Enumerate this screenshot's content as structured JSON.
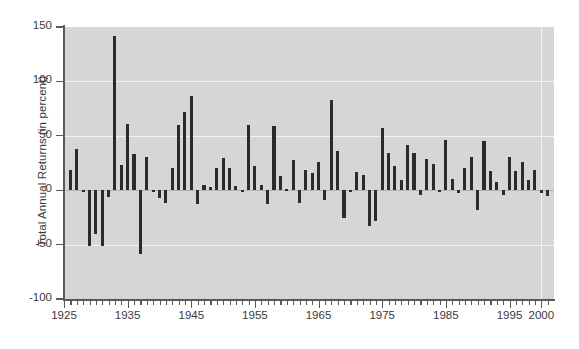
{
  "chart_data": {
    "type": "bar",
    "title": "",
    "xlabel": "",
    "ylabel": "Total Annual Returns (in percent)",
    "xlim": [
      1925,
      2002
    ],
    "ylim": [
      -100,
      150
    ],
    "yticks": [
      -100,
      -50,
      0,
      50,
      100,
      150
    ],
    "ytick_labels": [
      "-100",
      "-50",
      "0",
      "50",
      "100",
      "150"
    ],
    "xticks": [
      1925,
      1935,
      1945,
      1955,
      1965,
      1975,
      1985,
      1995,
      2000
    ],
    "xtick_labels": [
      "1925",
      "1935",
      "1945",
      "1955",
      "1965",
      "1975",
      "1985",
      "1995",
      "2000"
    ],
    "xtick_minor_step": 1,
    "grid": "white gridlines on gray panel, horizontal at y ticks and vertical at decade ticks",
    "legend": null,
    "bar_color": "#2b2b2b",
    "panel_color": "#d6d6d6",
    "gridline_color": "#f2f2f2",
    "x": [
      1926,
      1927,
      1928,
      1929,
      1930,
      1931,
      1932,
      1933,
      1934,
      1935,
      1936,
      1937,
      1938,
      1939,
      1940,
      1941,
      1942,
      1943,
      1944,
      1945,
      1946,
      1947,
      1948,
      1949,
      1950,
      1951,
      1952,
      1953,
      1954,
      1955,
      1956,
      1957,
      1958,
      1959,
      1960,
      1961,
      1962,
      1963,
      1964,
      1965,
      1966,
      1967,
      1968,
      1969,
      1970,
      1971,
      1972,
      1973,
      1974,
      1975,
      1976,
      1977,
      1978,
      1979,
      1980,
      1981,
      1982,
      1983,
      1984,
      1985,
      1986,
      1987,
      1988,
      1989,
      1990,
      1991,
      1992,
      1993,
      1994,
      1995,
      1996,
      1997,
      1998,
      1999,
      2000,
      2001
    ],
    "values": [
      19,
      38,
      -1,
      -51,
      -40,
      -51,
      -6,
      142,
      23,
      61,
      33,
      -59,
      31,
      -2,
      -7,
      -12,
      20,
      60,
      72,
      87,
      -13,
      5,
      3,
      20,
      30,
      20,
      4,
      -2,
      60,
      22,
      5,
      -13,
      59,
      13,
      1,
      28,
      -12,
      19,
      16,
      26,
      -9,
      83,
      36,
      -26,
      -2,
      17,
      14,
      -33,
      -28,
      57,
      34,
      22,
      9,
      42,
      34,
      -4,
      29,
      24,
      -1,
      46,
      10,
      -3,
      20,
      31,
      -18,
      45,
      18,
      8,
      -4,
      31,
      18,
      26,
      9,
      19,
      -3,
      -5
    ]
  }
}
